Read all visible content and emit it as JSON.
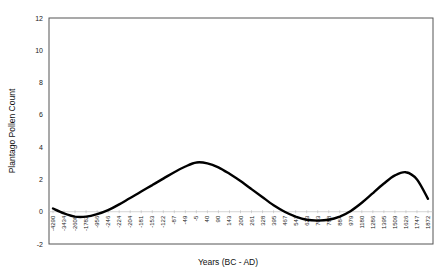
{
  "chart_data": {
    "type": "line",
    "title": "",
    "xlabel": "Years (BC - AD)",
    "ylabel": "Plantago Pollen Count",
    "ylim": [
      -2,
      12
    ],
    "yticks": [
      -2,
      0,
      2,
      4,
      6,
      8,
      10,
      12
    ],
    "grid": false,
    "legend": null,
    "categories": [
      "-4290",
      "-3434",
      "-2608",
      "-1782",
      "-956",
      "-246",
      "-224",
      "-204",
      "-181",
      "-153",
      "-122",
      "-87",
      "-49",
      "-5",
      "40",
      "90",
      "143",
      "200",
      "261",
      "328",
      "395",
      "467",
      "543",
      "623",
      "703",
      "788",
      "884",
      "979",
      "1180",
      "1286",
      "1395",
      "1509",
      "1626",
      "1747",
      "1872"
    ],
    "series": [
      {
        "name": "Plantago Pollen Count (smoothed)",
        "color": "#000000",
        "values": [
          0.2,
          -0.1,
          -0.3,
          -0.3,
          -0.15,
          0.1,
          0.45,
          0.85,
          1.25,
          1.65,
          2.05,
          2.45,
          2.8,
          3.05,
          3.0,
          2.75,
          2.35,
          1.9,
          1.4,
          0.9,
          0.4,
          0.0,
          -0.3,
          -0.5,
          -0.55,
          -0.5,
          -0.3,
          0.05,
          0.55,
          1.15,
          1.75,
          2.25,
          2.45,
          2.0,
          0.8
        ]
      }
    ]
  }
}
